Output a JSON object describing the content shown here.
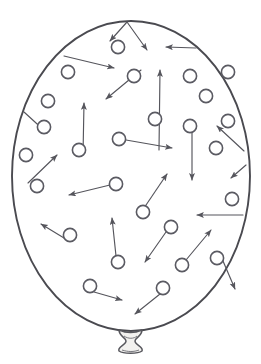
{
  "figure": {
    "title": "Balloon filled with gas molecules in random motion",
    "canvas": {
      "width": 261,
      "height": 364,
      "background": "#ffffff"
    },
    "colors": {
      "outline_stroke": "#4a4a50",
      "molecule_stroke": "#5a5a62",
      "molecule_fill": "#ffffff",
      "vector_stroke": "#55555c",
      "knot_fill": "#f2f1ef",
      "background": "#ffffff"
    },
    "balloon": {
      "name": "balloon-body",
      "shape": "ellipse",
      "center_x": 131,
      "center_y": 176,
      "radius_x": 119,
      "radius_y": 155,
      "stroke_width": 1.9,
      "top_y": 21,
      "bottom_y": 331,
      "left_x": 12,
      "right_x": 250
    },
    "knot": {
      "name": "balloon-knot",
      "center_x": 130,
      "center_y": 341,
      "width": 24,
      "height": 20
    },
    "molecule_radius": 6.6,
    "molecules": [
      {
        "id": 1,
        "cx": 118,
        "cy": 47,
        "vx": 18,
        "vy": 19
      },
      {
        "id": 2,
        "cx": 68,
        "cy": 72,
        "vx": 48,
        "vy": 15
      },
      {
        "id": 3,
        "cx": 134,
        "cy": 76,
        "vx": -28,
        "vy": 26
      },
      {
        "id": 4,
        "cx": 190,
        "cy": 76,
        "vx": -35,
        "vy": -27
      },
      {
        "id": 5,
        "cx": 48,
        "cy": 101,
        "vx": -32,
        "vy": 25
      },
      {
        "id": 6,
        "cx": 155,
        "cy": 119,
        "vx": 5,
        "vy": -42
      },
      {
        "id": 7,
        "cx": 79,
        "cy": 150,
        "vx": 4,
        "vy": -49
      },
      {
        "id": 8,
        "cx": 119,
        "cy": 139,
        "vx": 52,
        "vy": 9
      },
      {
        "id": 9,
        "cx": 190,
        "cy": 126,
        "vx": 4,
        "vy": 52
      },
      {
        "id": 10,
        "cx": 216,
        "cy": 148,
        "vx": -36,
        "vy": -22
      },
      {
        "id": 11,
        "cx": 228,
        "cy": 121,
        "vx": 22,
        "vy": 25
      },
      {
        "id": 12,
        "cx": 37,
        "cy": 186,
        "vx": 27,
        "vy": -36
      },
      {
        "id": 13,
        "cx": 116,
        "cy": 184,
        "vx": -38,
        "vy": 13
      },
      {
        "id": 14,
        "cx": 143,
        "cy": 212,
        "vx": 27,
        "vy": -37
      },
      {
        "id": 15,
        "cx": 232,
        "cy": 199,
        "vx": -47,
        "vy": 18
      },
      {
        "id": 16,
        "cx": 70,
        "cy": 235,
        "vx": -26,
        "vy": -30
      },
      {
        "id": 17,
        "cx": 118,
        "cy": 262,
        "vx": 3,
        "vy": -40
      },
      {
        "id": 18,
        "cx": 171,
        "cy": 227,
        "vx": -28,
        "vy": 33
      },
      {
        "id": 19,
        "cx": 182,
        "cy": 265,
        "vx": 30,
        "vy": -33
      },
      {
        "id": 20,
        "cx": 90,
        "cy": 286,
        "vx": 32,
        "vy": 11
      },
      {
        "id": 21,
        "cx": 163,
        "cy": 288,
        "vx": -27,
        "vy": 23
      },
      {
        "id": 22,
        "cx": 217,
        "cy": 258,
        "vx": 12,
        "vy": 31
      },
      {
        "id": 23,
        "cx": 44,
        "cy": 127,
        "vx": 0,
        "vy": 0
      },
      {
        "id": 24,
        "cx": 206,
        "cy": 96,
        "vx": 0,
        "vy": 0
      },
      {
        "id": 25,
        "cx": 228,
        "cy": 72,
        "vx": 0,
        "vy": 0
      },
      {
        "id": 26,
        "cx": 26,
        "cy": 155,
        "vx": 0,
        "vy": 0
      }
    ],
    "vectors": [
      {
        "name": "vector-1",
        "x1": 127,
        "y1": 22,
        "x2": 147,
        "y2": 50
      },
      {
        "name": "vector-2",
        "x1": 127,
        "y1": 22,
        "x2": 110,
        "y2": 41
      },
      {
        "name": "vector-3",
        "x1": 64,
        "y1": 56,
        "x2": 114,
        "y2": 68
      },
      {
        "name": "vector-4",
        "x1": 141,
        "y1": 70,
        "x2": 106,
        "y2": 99
      },
      {
        "name": "vector-5",
        "x1": 196,
        "y1": 48,
        "x2": 166,
        "y2": 47
      },
      {
        "name": "vector-6",
        "x1": 24,
        "y1": 112,
        "x2": 47,
        "y2": 133
      },
      {
        "name": "vector-7",
        "x1": 159,
        "y1": 150,
        "x2": 160,
        "y2": 70
      },
      {
        "name": "vector-8",
        "x1": 83,
        "y1": 155,
        "x2": 84,
        "y2": 103
      },
      {
        "name": "vector-9",
        "x1": 126,
        "y1": 140,
        "x2": 172,
        "y2": 148
      },
      {
        "name": "vector-10",
        "x1": 192,
        "y1": 128,
        "x2": 192,
        "y2": 180
      },
      {
        "name": "vector-11",
        "x1": 244,
        "y1": 151,
        "x2": 217,
        "y2": 126
      },
      {
        "name": "vector-12",
        "x1": 246,
        "y1": 165,
        "x2": 231,
        "y2": 178
      },
      {
        "name": "vector-13",
        "x1": 28,
        "y1": 183,
        "x2": 57,
        "y2": 155
      },
      {
        "name": "vector-14",
        "x1": 110,
        "y1": 185,
        "x2": 69,
        "y2": 195
      },
      {
        "name": "vector-15",
        "x1": 144,
        "y1": 208,
        "x2": 167,
        "y2": 174
      },
      {
        "name": "vector-16",
        "x1": 243,
        "y1": 215,
        "x2": 197,
        "y2": 215
      },
      {
        "name": "vector-17",
        "x1": 64,
        "y1": 238,
        "x2": 41,
        "y2": 224
      },
      {
        "name": "vector-18",
        "x1": 116,
        "y1": 256,
        "x2": 112,
        "y2": 218
      },
      {
        "name": "vector-19",
        "x1": 166,
        "y1": 232,
        "x2": 145,
        "y2": 262
      },
      {
        "name": "vector-20",
        "x1": 186,
        "y1": 260,
        "x2": 211,
        "y2": 230
      },
      {
        "name": "vector-21",
        "x1": 94,
        "y1": 292,
        "x2": 122,
        "y2": 300
      },
      {
        "name": "vector-22",
        "x1": 160,
        "y1": 294,
        "x2": 135,
        "y2": 314
      },
      {
        "name": "vector-23",
        "x1": 223,
        "y1": 261,
        "x2": 235,
        "y2": 289
      }
    ]
  }
}
